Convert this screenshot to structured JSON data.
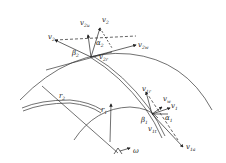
{
  "diagram": {
    "type": "impeller velocity triangles",
    "stroke_color": "#333333",
    "background": "#ffffff",
    "labels": {
      "v2": {
        "base": "v",
        "sub": "2"
      },
      "v2u": {
        "base": "v",
        "sub": "2u"
      },
      "v2_abs": {
        "base": "v",
        "sub": "2"
      },
      "alpha2": {
        "base": "α",
        "sub": "2"
      },
      "beta2": {
        "base": "β",
        "sub": "2"
      },
      "v2r": {
        "base": "v",
        "sub": "2r"
      },
      "v2w": {
        "base": "v",
        "sub": "2w"
      },
      "r2": {
        "base": "r",
        "sub": "2"
      },
      "r1": {
        "base": "r",
        "sub": "1"
      },
      "omega": {
        "base": "ω",
        "sub": ""
      },
      "v1r": {
        "base": "v",
        "sub": "1r"
      },
      "vw": {
        "base": "v",
        "sub": "w"
      },
      "v1": {
        "base": "v",
        "sub": "1"
      },
      "beta1": {
        "base": "β",
        "sub": "1"
      },
      "alpha1": {
        "base": "α",
        "sub": "1"
      },
      "v1t": {
        "base": "v",
        "sub": "1t"
      },
      "v1a": {
        "base": "v",
        "sub": "1a"
      }
    }
  }
}
